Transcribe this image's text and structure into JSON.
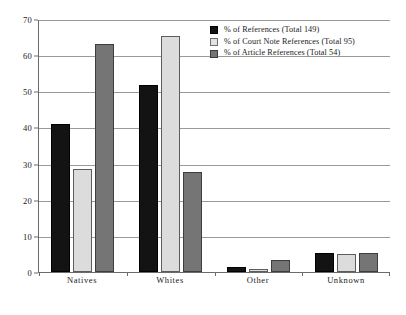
{
  "chart_data": {
    "type": "bar",
    "title": "",
    "subtitle": "",
    "xlabel": "",
    "ylabel": "",
    "ylim": [
      0,
      70
    ],
    "yticks": [
      0,
      10,
      20,
      30,
      40,
      50,
      60,
      70
    ],
    "ytick_labels": [
      "0",
      "10",
      "20",
      "30",
      "40",
      "50",
      "60",
      "70"
    ],
    "grid": true,
    "legend_position": "upper right inside plot",
    "categories": [
      "Natives",
      "Whites",
      "Other",
      "Unknown"
    ],
    "series": [
      {
        "name": "% of References (Total 149)",
        "color": "#131313",
        "values": [
          41.0,
          51.7,
          1.5,
          5.2
        ]
      },
      {
        "name": "% of  Court Note References (Total 95)",
        "color": "#dcdcdc",
        "values": [
          28.4,
          65.3,
          0.7,
          5.0
        ]
      },
      {
        "name": "% of  Article References (Total 54)",
        "color": "#757575",
        "values": [
          63.0,
          27.8,
          3.4,
          5.3
        ]
      }
    ]
  },
  "legend": {
    "entries": [
      {
        "label": "% of References (Total 149)",
        "swatch": "black-swatch"
      },
      {
        "label": "% of  Court Note References (Total 95)",
        "swatch": "light-gray-swatch"
      },
      {
        "label": "% of  Article References (Total 54)",
        "swatch": "dark-gray-swatch"
      }
    ]
  },
  "colors": {
    "series_black": "#131313",
    "series_light_gray": "#dcdcdc",
    "series_dark_gray": "#757575",
    "gridline": "#9a9a9a",
    "axis": "#6b6b6b",
    "background": "#ffffff",
    "text": "#1a1a1a"
  }
}
